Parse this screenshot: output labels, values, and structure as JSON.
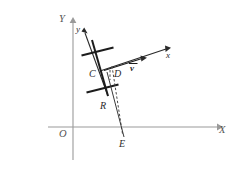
{
  "figure": {
    "background_color": "#ffffff",
    "width": 244,
    "height": 171,
    "global_axes": {
      "x_label": "X",
      "y_label": "Y",
      "origin_label": "O",
      "color": "#9a9a9a",
      "origin": [
        73,
        127
      ],
      "x_end": [
        220,
        127
      ],
      "y_end": [
        73,
        20
      ]
    },
    "local_axes": {
      "x_label": "x",
      "y_label": "y",
      "color": "#2a2a2a",
      "origin": [
        100,
        70
      ],
      "x_end": [
        172,
        47
      ],
      "y_end": [
        84,
        30
      ]
    },
    "vector": {
      "label": "v",
      "color": "#1c1c1c",
      "start": [
        104,
        70
      ],
      "end": [
        146,
        57
      ]
    },
    "points": [
      {
        "label": "C",
        "x": 94,
        "y": 74,
        "interactable": false
      },
      {
        "label": "D",
        "x": 117,
        "y": 74,
        "interactable": false
      },
      {
        "label": "R",
        "x": 104,
        "y": 106,
        "interactable": false
      },
      {
        "label": "E",
        "x": 122,
        "y": 143,
        "interactable": false
      }
    ],
    "rod": {
      "color": "#1c1c1c",
      "top": [
        92,
        40
      ],
      "bottom": [
        108,
        96
      ],
      "crossbars": [
        {
          "center": [
            97,
            52
          ],
          "half_length": 17
        },
        {
          "center": [
            102,
            89
          ],
          "half_length": 17
        }
      ]
    },
    "dashed_drop": {
      "from": [
        112,
        68
      ],
      "to": [
        122,
        136
      ],
      "style": "dashed",
      "color": "#4a4a4a"
    },
    "solid_drop": {
      "from": [
        106,
        70
      ],
      "to": [
        124,
        137
      ],
      "style": "solid",
      "color": "#3a3a3a"
    }
  }
}
